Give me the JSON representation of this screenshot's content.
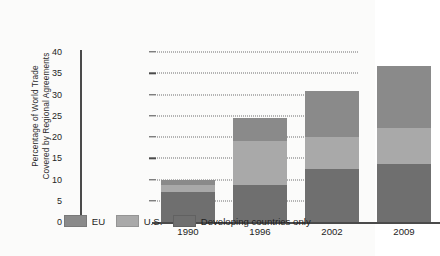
{
  "chart_data": {
    "type": "bar",
    "subtype": "stacked",
    "title": "",
    "xlabel": "",
    "ylabel": "Percentage of World Trade Covered by Regional Agreements",
    "ylabel_line1": "Percentage of World Trade",
    "ylabel_line2": "Covered by Regional Agreements",
    "categories": [
      "1990",
      "1996",
      "2002",
      "2009"
    ],
    "ylim": [
      0,
      40
    ],
    "yticks": [
      0,
      5,
      10,
      15,
      20,
      25,
      30,
      35,
      40
    ],
    "ytick_labels": [
      "0",
      "5",
      "10",
      "15",
      "20",
      "25",
      "30",
      "35",
      "40"
    ],
    "grid": "horizontal-dotted",
    "legend_position": "bottom",
    "series": [
      {
        "name": "Developing countries only",
        "values": [
          7.0,
          8.6,
          12.4,
          13.6
        ],
        "color": "#6f6f6f"
      },
      {
        "name": "U.S.",
        "values": [
          1.6,
          10.4,
          7.6,
          8.6
        ],
        "color": "#a9a9a9"
      },
      {
        "name": "EU",
        "values": [
          1.4,
          5.5,
          10.9,
          14.5
        ],
        "color": "#8a8a8a"
      }
    ],
    "totals": [
      10.0,
      24.5,
      30.9,
      36.7
    ]
  },
  "legend": {
    "items": [
      {
        "label": "EU",
        "color": "#8a8a8a"
      },
      {
        "label": "U.S.",
        "color": "#a9a9a9"
      },
      {
        "label": "Developing countries only",
        "color": "#6f6f6f"
      }
    ]
  },
  "colors": {
    "background": "#fbfbfa",
    "axis": "#4a4a4a",
    "grid": "#6f6f6f",
    "text": "#1f1f1f"
  }
}
